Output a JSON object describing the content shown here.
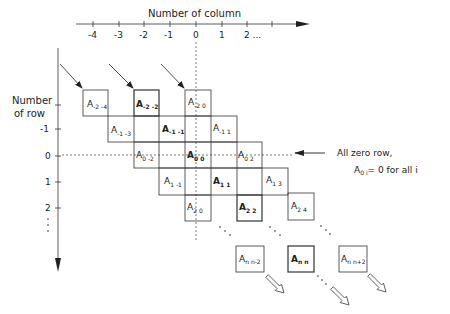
{
  "x_axis": {
    "title": "Number of column",
    "ticks": [
      "-4",
      "-3",
      "-2",
      "-1",
      "0",
      "1",
      "2 ..."
    ]
  },
  "y_axis": {
    "title_line1": "Number",
    "title_line2": "of row",
    "ticks": [
      "-1",
      "0",
      "1",
      "2",
      "⋮"
    ]
  },
  "cells": [
    {
      "main": "A",
      "sub": "-2 -4",
      "bold": false
    },
    {
      "main": "A",
      "sub": "-2 -2",
      "bold": true
    },
    {
      "main": "A",
      "sub": "-2 0",
      "bold": false
    },
    {
      "main": "A",
      "sub": "-1 -3",
      "bold": false
    },
    {
      "main": "A",
      "sub": "-1 -1",
      "bold": true
    },
    {
      "main": "A",
      "sub": "-1 1",
      "bold": false
    },
    {
      "main": "A",
      "sub": "0 -2",
      "bold": false
    },
    {
      "main": "A",
      "sub": "0 0",
      "bold": true
    },
    {
      "main": "A",
      "sub": "0 2",
      "bold": false
    },
    {
      "main": "A",
      "sub": "1 -1",
      "bold": false
    },
    {
      "main": "A",
      "sub": "1 1",
      "bold": true
    },
    {
      "main": "A",
      "sub": "1 3",
      "bold": false
    },
    {
      "main": "A",
      "sub": "2 0",
      "bold": false
    },
    {
      "main": "A",
      "sub": "2 2",
      "bold": true
    },
    {
      "main": "A",
      "sub": "2 4",
      "bold": false
    },
    {
      "main": "A",
      "sub": "n n-2",
      "bold": false
    },
    {
      "main": "A",
      "sub": "n n",
      "bold": true
    },
    {
      "main": "A",
      "sub": "n n+2",
      "bold": false
    }
  ],
  "annotation": {
    "line1": "All zero row,",
    "line2_main": "A",
    "line2_sub": "0 i",
    "line2_rest": "= 0  for all i"
  },
  "ellipsis": "· · ·"
}
